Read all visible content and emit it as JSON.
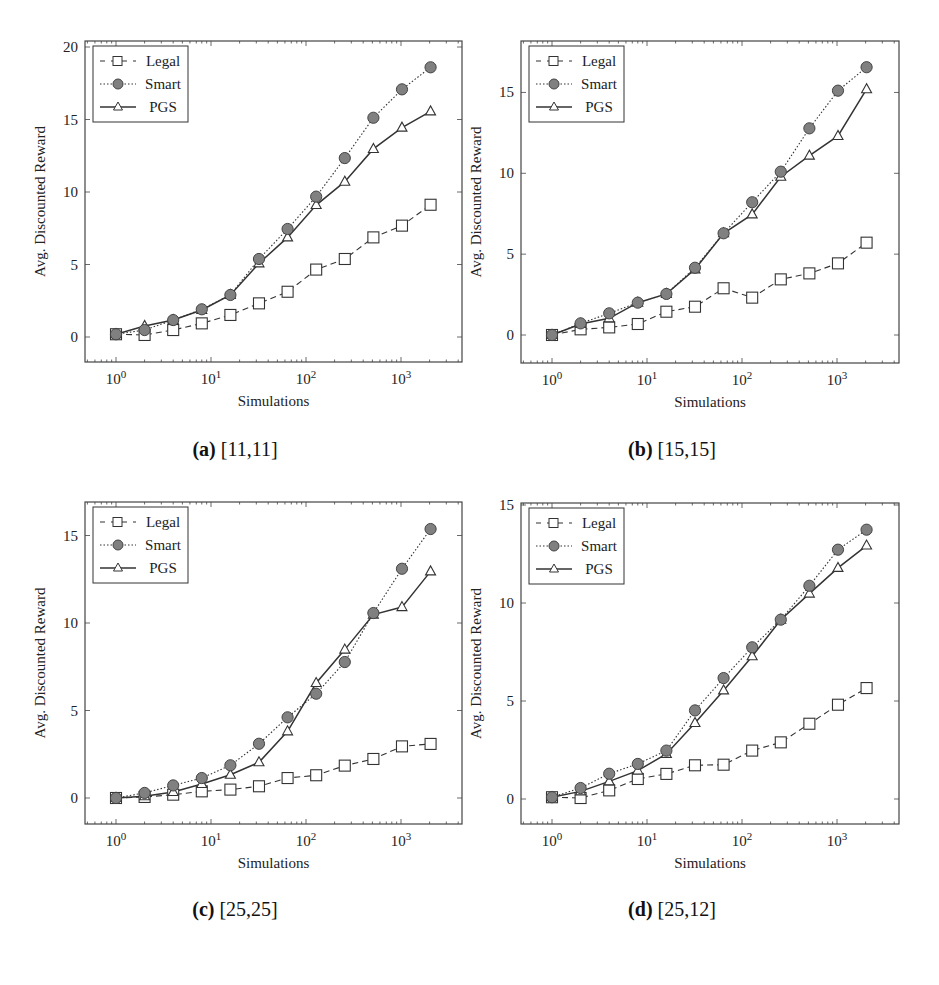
{
  "chart_data": [
    {
      "type": "line",
      "panel": "a",
      "caption_label": "(a)",
      "caption_text": "[11,11]",
      "title": "(a) [11,11]",
      "xlabel": "Simulations",
      "ylabel": "Avg. Discounted Reward",
      "xscale": "log",
      "x": [
        1,
        2,
        4,
        8,
        16,
        32,
        64,
        128,
        256,
        512,
        1024,
        2048
      ],
      "xticks": [
        "10^0",
        "10^1",
        "10^2",
        "10^3"
      ],
      "yticks": [
        0,
        5,
        10,
        15,
        20
      ],
      "ylim": [
        -1.7,
        20.7
      ],
      "legend_position": "upper left",
      "grid": false,
      "series": [
        {
          "name": "Legal",
          "style": "dashed",
          "marker": "open-square",
          "values": [
            0.19,
            0.14,
            0.48,
            0.94,
            1.52,
            2.32,
            3.12,
            4.65,
            5.38,
            6.87,
            7.68,
            9.12
          ]
        },
        {
          "name": "Smart",
          "style": "dotted",
          "marker": "filled-circle",
          "values": [
            0.19,
            0.48,
            1.17,
            1.91,
            2.9,
            5.38,
            7.45,
            9.68,
            12.34,
            15.12,
            17.08,
            18.6
          ]
        },
        {
          "name": "PGS",
          "style": "solid",
          "marker": "open-triangle",
          "values": [
            0.19,
            0.76,
            1.17,
            1.86,
            2.9,
            5.08,
            6.87,
            9.1,
            10.71,
            12.97,
            14.44,
            15.56
          ]
        }
      ]
    },
    {
      "type": "line",
      "panel": "b",
      "caption_label": "(b)",
      "caption_text": "[15,15]",
      "title": "(b) [15,15]",
      "xlabel": "Simulations",
      "ylabel": "Avg. Discounted Reward",
      "xscale": "log",
      "x": [
        1,
        2,
        4,
        8,
        16,
        32,
        64,
        128,
        256,
        512,
        1024,
        2048
      ],
      "xticks": [
        "10^0",
        "10^1",
        "10^2",
        "10^3"
      ],
      "yticks": [
        0,
        5,
        10,
        15
      ],
      "ylim": [
        -1.7,
        18.2
      ],
      "legend_position": "upper left",
      "grid": false,
      "series": [
        {
          "name": "Legal",
          "style": "dashed",
          "marker": "open-square",
          "values": [
            0.0,
            0.35,
            0.47,
            0.68,
            1.44,
            1.75,
            2.89,
            2.31,
            3.44,
            3.81,
            4.43,
            5.71
          ]
        },
        {
          "name": "Smart",
          "style": "dotted",
          "marker": "filled-circle",
          "values": [
            0.0,
            0.72,
            1.34,
            2.0,
            2.54,
            4.16,
            6.29,
            8.21,
            10.1,
            12.78,
            15.11,
            16.56
          ]
        },
        {
          "name": "PGS",
          "style": "solid",
          "marker": "open-triangle",
          "values": [
            0.0,
            0.68,
            1.03,
            2.0,
            2.54,
            4.06,
            6.29,
            7.46,
            9.79,
            11.09,
            12.31,
            15.2
          ]
        }
      ]
    },
    {
      "type": "line",
      "panel": "c",
      "caption_label": "(c)",
      "caption_text": "[25,25]",
      "title": "(c) [25,25]",
      "xlabel": "Simulations",
      "ylabel": "Avg. Discounted Reward",
      "xscale": "log",
      "x": [
        1,
        2,
        4,
        8,
        16,
        32,
        64,
        128,
        256,
        512,
        1024,
        2048
      ],
      "xticks": [
        "10^0",
        "10^1",
        "10^2",
        "10^3"
      ],
      "yticks": [
        0,
        5,
        10,
        15
      ],
      "ylim": [
        -1.5,
        16.8
      ],
      "legend_position": "upper left",
      "grid": false,
      "series": [
        {
          "name": "Legal",
          "style": "dashed",
          "marker": "open-square",
          "values": [
            0.0,
            0.06,
            0.19,
            0.38,
            0.48,
            0.67,
            1.14,
            1.3,
            1.85,
            2.23,
            2.95,
            3.09
          ]
        },
        {
          "name": "Smart",
          "style": "dotted",
          "marker": "filled-circle",
          "values": [
            0.0,
            0.29,
            0.72,
            1.14,
            1.87,
            3.1,
            4.61,
            5.96,
            7.77,
            10.57,
            13.1,
            15.37
          ]
        },
        {
          "name": "PGS",
          "style": "solid",
          "marker": "open-triangle",
          "values": [
            0.0,
            0.1,
            0.34,
            0.8,
            1.33,
            2.04,
            3.81,
            6.57,
            8.48,
            10.48,
            10.91,
            12.95
          ]
        }
      ]
    },
    {
      "type": "line",
      "panel": "d",
      "caption_label": "(d)",
      "caption_text": "[25,12]",
      "title": "(d) [25,12]",
      "xlabel": "Simulations",
      "ylabel": "Avg. Discounted Reward",
      "xscale": "log",
      "x": [
        1,
        2,
        4,
        8,
        16,
        32,
        64,
        128,
        256,
        512,
        1024,
        2048
      ],
      "xticks": [
        "10^0",
        "10^1",
        "10^2",
        "10^3"
      ],
      "yticks": [
        0,
        5,
        10,
        15
      ],
      "ylim": [
        -1.3,
        15.2
      ],
      "legend_position": "upper left",
      "grid": false,
      "series": [
        {
          "name": "Legal",
          "style": "dashed",
          "marker": "open-square",
          "values": [
            0.09,
            0.05,
            0.44,
            1.02,
            1.28,
            1.72,
            1.75,
            2.47,
            2.89,
            3.84,
            4.81,
            5.66
          ]
        },
        {
          "name": "Smart",
          "style": "dotted",
          "marker": "filled-circle",
          "values": [
            0.09,
            0.56,
            1.29,
            1.79,
            2.47,
            4.52,
            6.17,
            7.74,
            9.15,
            10.88,
            12.72,
            13.74
          ]
        },
        {
          "name": "PGS",
          "style": "solid",
          "marker": "open-triangle",
          "values": [
            0.09,
            0.39,
            0.9,
            1.45,
            2.3,
            3.88,
            5.54,
            7.28,
            9.15,
            10.48,
            11.79,
            12.93
          ]
        }
      ]
    }
  ],
  "layout": {
    "panels": [
      {
        "left": 85,
        "top": 41,
        "right": 462,
        "bottom": 362,
        "x0px": 116,
        "decade_px": 95,
        "y0px": 337,
        "px_per_unit": 14.5
      },
      {
        "left": 521,
        "top": 41,
        "right": 899,
        "bottom": 363,
        "x0px": 552,
        "decade_px": 95,
        "y0px": 335,
        "px_per_unit": 16.17
      },
      {
        "left": 85,
        "top": 502,
        "right": 462,
        "bottom": 824,
        "x0px": 116,
        "decade_px": 95,
        "y0px": 798,
        "px_per_unit": 17.5
      },
      {
        "left": 521,
        "top": 503,
        "right": 899,
        "bottom": 824,
        "x0px": 552,
        "decade_px": 95,
        "y0px": 799,
        "px_per_unit": 19.6
      }
    ],
    "captions": [
      {
        "x": 235,
        "y": 450
      },
      {
        "x": 672,
        "y": 450
      },
      {
        "x": 235,
        "y": 910
      },
      {
        "x": 672,
        "y": 910
      }
    ],
    "colors": {
      "line": "#333333",
      "smart_fill": "#808080",
      "axis": "#444444",
      "legend_border": "#333333"
    }
  }
}
